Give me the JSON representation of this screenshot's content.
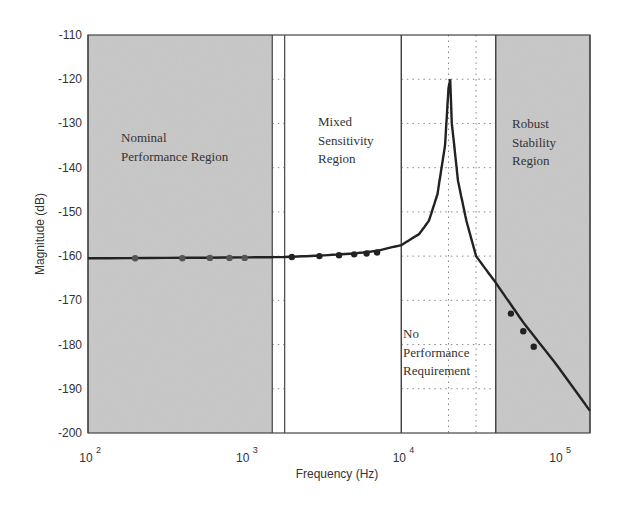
{
  "chart_data": {
    "type": "line",
    "title": "",
    "xlabel": "Frequency (Hz)",
    "ylabel": "Magnitude (dB)",
    "xscale": "log",
    "xlim": [
      100,
      160000
    ],
    "ylim": [
      -200,
      -110
    ],
    "grid": "dotted, visible in white regions only",
    "x_ticks": [
      {
        "value": 100,
        "base": "10",
        "exp": "2"
      },
      {
        "value": 1000,
        "base": "10",
        "exp": "3"
      },
      {
        "value": 10000,
        "base": "10",
        "exp": "4"
      },
      {
        "value": 100000,
        "base": "10",
        "exp": "5"
      }
    ],
    "y_ticks": [
      -110,
      -120,
      -130,
      -140,
      -150,
      -160,
      -170,
      -180,
      -190,
      -200
    ],
    "regions": [
      {
        "name": "Nominal Performance Region",
        "lines": [
          "Nominal",
          "Performance Region"
        ],
        "x_start": 100,
        "x_end": 1500,
        "shaded": true
      },
      {
        "name": "Mixed Sensitivity Region",
        "lines": [
          "Mixed",
          "Sensitivity",
          "Region"
        ],
        "x_start": 1800,
        "x_end": 10000,
        "shaded": false
      },
      {
        "name": "No Performance Requirement",
        "lines": [
          "No",
          "Performance",
          "Requirement"
        ],
        "x_start": 10000,
        "x_end": 40000,
        "shaded": false
      },
      {
        "name": "Robust Stability Region",
        "lines": [
          "Robust",
          "Stability",
          "Region"
        ],
        "x_start": 40000,
        "x_end": 160000,
        "shaded": true
      }
    ],
    "series": [
      {
        "name": "Magnitude response",
        "x": [
          100,
          1000,
          1800,
          3000,
          5000,
          7000,
          10000,
          13000,
          15000,
          17000,
          19000,
          20000,
          20500,
          21000,
          23000,
          26000,
          30000,
          40000,
          60000,
          100000,
          160000
        ],
        "y": [
          -160.5,
          -160.3,
          -160.2,
          -159.9,
          -159.4,
          -158.8,
          -157.5,
          -155,
          -152,
          -146,
          -135,
          -122,
          -120,
          -130,
          -143,
          -152,
          -160,
          -166,
          -175,
          -185,
          -195
        ]
      }
    ],
    "markers": {
      "x": [
        200,
        400,
        600,
        800,
        1000,
        2000,
        3000,
        4000,
        5000,
        6000,
        7000,
        50000,
        60000,
        70000
      ],
      "y": [
        -160.5,
        -160.5,
        -160.4,
        -160.4,
        -160.4,
        -160.2,
        -160,
        -159.8,
        -159.6,
        -159.4,
        -159.2,
        -173,
        -177,
        -180.5
      ]
    }
  },
  "labels": {
    "ylabel": "Magnitude (dB)",
    "xlabel": "Frequency (Hz)"
  }
}
